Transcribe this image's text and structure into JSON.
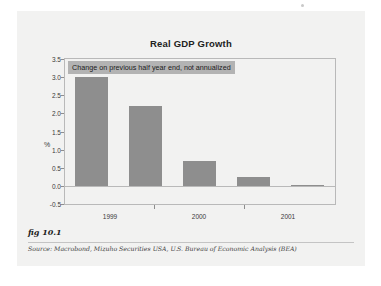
{
  "figure": {
    "fig_label": "fig 10.1",
    "source_prefix": "Source:",
    "source_text": "Macrobond, Mizuho Securities USA, U.S. Bureau of Economic Analysis (BEA)"
  },
  "colors": {
    "bar": "#8e8e8e",
    "plot_background": "#f2f2f1",
    "panel_background": "#f2f2f1",
    "axis": "#b9b9b9",
    "annotation_background": "#b3b3b3",
    "text": "#3a3a3a"
  },
  "chart_data": {
    "type": "bar",
    "title": "Real GDP Growth",
    "annotation": "Change on previous half year end, not annualized",
    "xlabel": "",
    "ylabel": "%",
    "categories": [
      "1999 H1",
      "1999 H2",
      "2000 H1",
      "2000 H2",
      "2001 H1"
    ],
    "values": [
      3.0,
      2.2,
      0.7,
      0.25,
      0.0
    ],
    "ylim": [
      -0.5,
      3.5
    ],
    "yticks": [
      3.5,
      3.0,
      2.5,
      2.0,
      1.5,
      1.0,
      0.5,
      0.0,
      -0.5
    ],
    "ytick_labels": [
      "3.5",
      "3.0",
      "2.5",
      "2.0",
      "1.5",
      "1.0",
      "0.5",
      "0.0",
      "-0.5"
    ],
    "xtick_labels": [
      "1999",
      "2000",
      "2001"
    ],
    "xtick_positions": [
      0.17,
      0.5,
      0.83
    ],
    "xtick_mark_positions": [
      0.335,
      0.665
    ],
    "grid": false,
    "legend": "none"
  }
}
